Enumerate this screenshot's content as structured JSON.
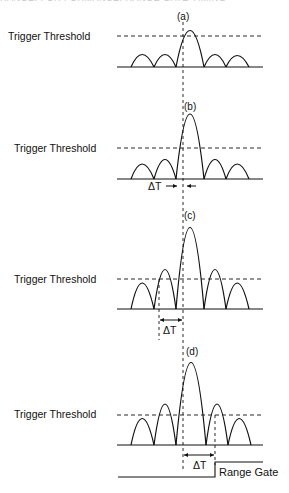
{
  "header": {
    "text": "RANGE: FOR FORMANCE: RANGE GATE TIMING"
  },
  "diagram": {
    "threshold_label": "Trigger Threshold",
    "delta_label": "ΔT",
    "range_gate_label": "Range Gate",
    "panels": [
      {
        "id": "a",
        "label": "(a)",
        "threshold_label": "Trigger Threshold"
      },
      {
        "id": "b",
        "label": "(b)",
        "threshold_label": "Trigger Threshold",
        "delta_label": "ΔT"
      },
      {
        "id": "c",
        "label": "(c)",
        "threshold_label": "Trigger Threshold",
        "delta_label": "ΔT"
      },
      {
        "id": "d",
        "label": "(d)",
        "threshold_label": "Trigger Threshold",
        "delta_label": "ΔT",
        "range_gate_label": "Range Gate"
      }
    ]
  }
}
